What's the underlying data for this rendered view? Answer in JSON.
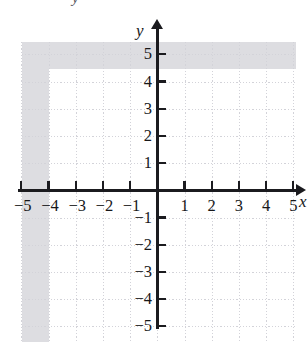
{
  "chart_data": {
    "type": "scatter",
    "title": "",
    "subtitle": "",
    "xlabel": "x",
    "ylabel": "y",
    "xlim": [
      -5.5,
      5.5
    ],
    "ylim": [
      -5.5,
      5.5
    ],
    "grid": true,
    "grid_style": "dotted",
    "grid_spacing": 1,
    "legend": null,
    "series": [],
    "values": [],
    "x": [],
    "annotations": [],
    "x_ticks": [
      {
        "value": -5,
        "label": "−5"
      },
      {
        "value": -4,
        "label": "−4"
      },
      {
        "value": -3,
        "label": "−3"
      },
      {
        "value": -2,
        "label": "−2"
      },
      {
        "value": -1,
        "label": "−1"
      },
      {
        "value": 1,
        "label": "1"
      },
      {
        "value": 2,
        "label": "2"
      },
      {
        "value": 3,
        "label": "3"
      },
      {
        "value": 4,
        "label": "4"
      },
      {
        "value": 5,
        "label": "5"
      }
    ],
    "y_ticks": [
      {
        "value": 5,
        "label": "5"
      },
      {
        "value": 4,
        "label": "4"
      },
      {
        "value": 3,
        "label": "3"
      },
      {
        "value": 2,
        "label": "2"
      },
      {
        "value": 1,
        "label": "1"
      },
      {
        "value": -1,
        "label": "−1"
      },
      {
        "value": -2,
        "label": "−2"
      },
      {
        "value": -3,
        "label": "−3"
      },
      {
        "value": -4,
        "label": "−4"
      },
      {
        "value": -5,
        "label": "−5"
      }
    ]
  },
  "axes": {
    "y_axis_label": "y",
    "x_axis_label": "x"
  },
  "artifacts": {
    "top_clipped_glyph": "y"
  },
  "colors": {
    "axis": "#1b1b1f",
    "grid": "#c9c9cf",
    "label": "#171719",
    "background": "#ffffff"
  }
}
